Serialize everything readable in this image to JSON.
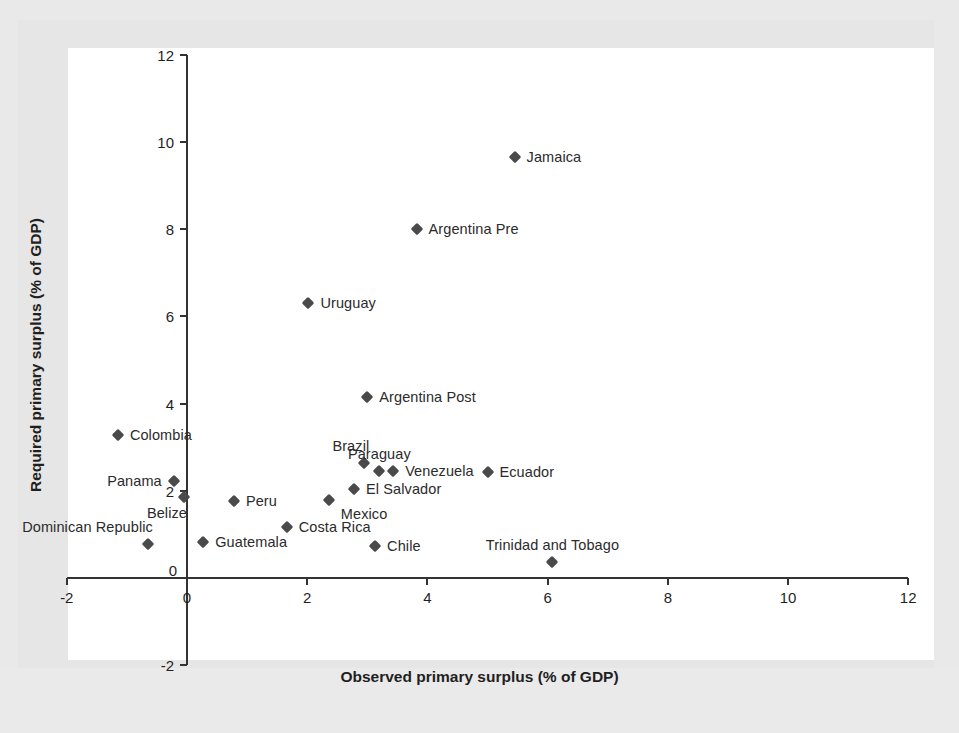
{
  "figure": {
    "background_color": "#e9e9e9",
    "paper_color": "#ffffff",
    "marker_color": "#4a4a4a",
    "axis_color": "#333333"
  },
  "chart_data": {
    "type": "scatter",
    "title": "",
    "xlabel": "Observed primary surplus (% of GDP)",
    "ylabel": "Required primary surplus (% of GDP)",
    "xlim": [
      -2,
      12
    ],
    "ylim": [
      -2,
      12
    ],
    "xticks": [
      -2,
      0,
      2,
      4,
      6,
      8,
      10,
      12
    ],
    "xtick_labels": [
      "-2",
      "0",
      "2",
      "4",
      "6",
      "8",
      "10",
      "12"
    ],
    "yticks": [
      -2,
      0,
      2,
      4,
      6,
      8,
      10,
      12
    ],
    "ytick_labels": [
      "-2",
      "0",
      "2",
      "4",
      "6",
      "8",
      "10",
      "12"
    ],
    "grid": false,
    "legend": "none",
    "marker": "diamond",
    "points": [
      {
        "label": "Jamaica",
        "x": 5.45,
        "y": 9.65,
        "label_pos": "right"
      },
      {
        "label": "Argentina Pre",
        "x": 3.82,
        "y": 8.0,
        "label_pos": "right"
      },
      {
        "label": "Uruguay",
        "x": 2.02,
        "y": 6.3,
        "label_pos": "right"
      },
      {
        "label": "Argentina Post",
        "x": 3.0,
        "y": 4.15,
        "label_pos": "right"
      },
      {
        "label": "Colombia",
        "x": -1.15,
        "y": 3.27,
        "label_pos": "right"
      },
      {
        "label": "Brazil",
        "x": 2.95,
        "y": 2.63,
        "label_pos": "above-left"
      },
      {
        "label": "Paraguay",
        "x": 3.2,
        "y": 2.46,
        "label_pos": "above"
      },
      {
        "label": "Venezuela",
        "x": 3.43,
        "y": 2.46,
        "label_pos": "right"
      },
      {
        "label": "Ecuador",
        "x": 5.0,
        "y": 2.44,
        "label_pos": "right"
      },
      {
        "label": "El Salvador",
        "x": 2.78,
        "y": 2.05,
        "label_pos": "right"
      },
      {
        "label": "Panama",
        "x": -0.22,
        "y": 2.23,
        "label_pos": "left"
      },
      {
        "label": "Belize",
        "x": -0.05,
        "y": 1.86,
        "label_pos": "below-left"
      },
      {
        "label": "Mexico",
        "x": 2.36,
        "y": 1.8,
        "label_pos": "below-right"
      },
      {
        "label": "Peru",
        "x": 0.78,
        "y": 1.77,
        "label_pos": "right"
      },
      {
        "label": "Costa Rica",
        "x": 1.66,
        "y": 1.18,
        "label_pos": "right"
      },
      {
        "label": "Dominican Republic",
        "x": -0.65,
        "y": 0.78,
        "label_pos": "above-left"
      },
      {
        "label": "Guatemala",
        "x": 0.27,
        "y": 0.83,
        "label_pos": "right"
      },
      {
        "label": "Chile",
        "x": 3.13,
        "y": 0.73,
        "label_pos": "right"
      },
      {
        "label": "Trinidad and Tobago",
        "x": 6.08,
        "y": 0.37,
        "label_pos": "above"
      }
    ]
  }
}
